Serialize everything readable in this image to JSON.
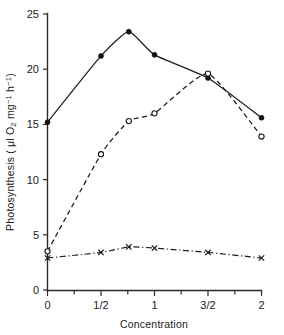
{
  "chart_data": {
    "type": "line",
    "title": "",
    "xlabel": "Concentration",
    "ylabel": "Photosynthesis ( μl O₂ mg⁻¹ h⁻¹)",
    "xlabel_parts": {
      "text": "Concentration"
    },
    "ylabel_parts": {
      "prefix": "Photosynthesis ( ",
      "mu": "μ",
      "unit_l": "l O",
      "sub_2": "2",
      "unit_mg": " mg",
      "sup_neg1_a": "−1",
      "unit_h": " h",
      "sup_neg1_b": "−1",
      "suffix": ")"
    },
    "xlim": [
      0,
      2
    ],
    "ylim": [
      0,
      25
    ],
    "grid": false,
    "legend": "none",
    "x_ticks_major": [
      0,
      0.5,
      1,
      1.5,
      2
    ],
    "x_ticklabels": [
      "0",
      "1/2",
      "1",
      "3/2",
      "2"
    ],
    "x_ticks_minor": [
      0.25,
      0.75,
      1.25,
      1.75
    ],
    "y_ticks_major": [
      0,
      5,
      10,
      15,
      20,
      25
    ],
    "y_ticklabels": [
      "0",
      "5",
      "10",
      "15",
      "20",
      "25"
    ],
    "series": [
      {
        "name": "series-filled-circle",
        "marker": "filled-circle",
        "linestyle": "solid",
        "x": [
          0,
          0.5,
          0.76,
          1,
          1.5,
          2
        ],
        "values": [
          15.2,
          21.2,
          23.4,
          21.3,
          19.2,
          15.6
        ]
      },
      {
        "name": "series-open-circle",
        "marker": "open-circle",
        "linestyle": "dashed",
        "x": [
          0,
          0.5,
          0.76,
          1,
          1.5,
          2
        ],
        "values": [
          3.5,
          12.3,
          15.3,
          16.0,
          19.6,
          13.9
        ]
      },
      {
        "name": "series-cross",
        "marker": "cross",
        "linestyle": "dash-dot",
        "x": [
          0,
          0.5,
          0.76,
          1,
          1.5,
          2
        ],
        "values": [
          2.9,
          3.4,
          3.9,
          3.8,
          3.4,
          2.9
        ]
      }
    ]
  },
  "figure": {
    "background_color": "#ffffff",
    "ink_color": "#1a1a1a"
  }
}
